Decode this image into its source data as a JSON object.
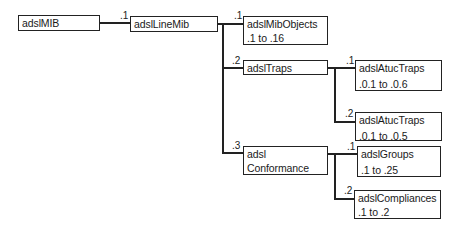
{
  "diagram": {
    "type": "tree",
    "nodes": {
      "root": {
        "name": "adslMIB"
      },
      "lineMib": {
        "name": "adslLineMib",
        "edge_label": ".1"
      },
      "mibObjects": {
        "name": "adslMibObjects",
        "range": ".1 to .16",
        "edge_label": ".1"
      },
      "traps": {
        "name": "adslTraps",
        "edge_label": ".2"
      },
      "atucTraps1": {
        "name": "adslAtucTraps",
        "range": ".0.1 to .0.6",
        "edge_label": ".1"
      },
      "atucTraps2": {
        "name": "adslAtucTraps",
        "range": ".0.1 to .0.5",
        "edge_label": ".2"
      },
      "conformance": {
        "name_line1": "adsl",
        "name_line2": "Conformance",
        "edge_label": ".3"
      },
      "groups": {
        "name": "adslGroups",
        "range": ".1 to .25",
        "edge_label": ".1"
      },
      "compliances": {
        "name": "adslCompliances",
        "range": ".1 to .2",
        "edge_label": ".2"
      }
    },
    "edges": [
      {
        "from": "adslMIB",
        "to": "adslLineMib",
        "label": ".1"
      },
      {
        "from": "adslLineMib",
        "to": "adslMibObjects",
        "label": ".1"
      },
      {
        "from": "adslLineMib",
        "to": "adslTraps",
        "label": ".2"
      },
      {
        "from": "adslLineMib",
        "to": "adsl Conformance",
        "label": ".3"
      },
      {
        "from": "adslTraps",
        "to": "adslAtucTraps (.0.1 to .0.6)",
        "label": ".1"
      },
      {
        "from": "adslTraps",
        "to": "adslAtucTraps (.0.1 to .0.5)",
        "label": ".2"
      },
      {
        "from": "adsl Conformance",
        "to": "adslGroups",
        "label": ".1"
      },
      {
        "from": "adsl Conformance",
        "to": "adslCompliances",
        "label": ".2"
      }
    ],
    "colors": {
      "line": "#222222",
      "box_fill": "#ffffff",
      "text": "#1a1a1a"
    }
  }
}
